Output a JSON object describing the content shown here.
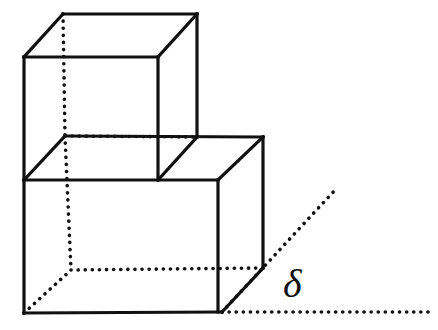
{
  "figure": {
    "background_color": "#ffffff",
    "stroke_color": "#111111",
    "solid_stroke_width": 3.2,
    "dotted_stroke_width": 3.6,
    "dot_pattern": "0.1 7",
    "canvas": {
      "width": 438,
      "height": 330
    },
    "labels": [
      {
        "name": "delta-angle-label",
        "text": "δ",
        "x": 283,
        "y": 297,
        "font_size": 40,
        "style": "italic"
      }
    ],
    "solid_edges": [
      {
        "name": "upper-top-back-edge",
        "x1": 63,
        "y1": 14,
        "x2": 197,
        "y2": 14
      },
      {
        "name": "upper-top-left-edge",
        "x1": 63,
        "y1": 14,
        "x2": 24,
        "y2": 57
      },
      {
        "name": "upper-top-right-edge",
        "x1": 197,
        "y1": 14,
        "x2": 158,
        "y2": 57
      },
      {
        "name": "upper-top-front-edge",
        "x1": 24,
        "y1": 57,
        "x2": 158,
        "y2": 57
      },
      {
        "name": "upper-left-vertical-edge",
        "x1": 24,
        "y1": 57,
        "x2": 24,
        "y2": 180
      },
      {
        "name": "upper-right-vertical-edge",
        "x1": 158,
        "y1": 57,
        "x2": 158,
        "y2": 180
      },
      {
        "name": "upper-back-right-vertical",
        "x1": 197,
        "y1": 14,
        "x2": 197,
        "y2": 137
      },
      {
        "name": "mid-left-diagonal-edge",
        "x1": 24,
        "y1": 180,
        "x2": 65,
        "y2": 136
      },
      {
        "name": "mid-platform-back-edge",
        "x1": 65,
        "y1": 136,
        "x2": 263,
        "y2": 137
      },
      {
        "name": "mid-right-diagonal-edge",
        "x1": 158,
        "y1": 180,
        "x2": 197,
        "y2": 137
      },
      {
        "name": "lower-top-front-edge",
        "x1": 24,
        "y1": 180,
        "x2": 218,
        "y2": 180
      },
      {
        "name": "lower-top-right-diagonal",
        "x1": 218,
        "y1": 180,
        "x2": 263,
        "y2": 137
      },
      {
        "name": "lower-back-right-vertical",
        "x1": 263,
        "y1": 137,
        "x2": 263,
        "y2": 268
      },
      {
        "name": "lower-left-vertical-edge",
        "x1": 24,
        "y1": 180,
        "x2": 24,
        "y2": 313
      },
      {
        "name": "lower-front-right-vertical",
        "x1": 218,
        "y1": 180,
        "x2": 218,
        "y2": 312
      },
      {
        "name": "lower-bottom-front-edge",
        "x1": 24,
        "y1": 313,
        "x2": 222,
        "y2": 312
      },
      {
        "name": "lower-bottom-right-diagonal",
        "x1": 222,
        "y1": 312,
        "x2": 263,
        "y2": 268
      }
    ],
    "dotted_edges": [
      {
        "name": "hidden-upper-back-left-vertical",
        "x1": 63,
        "y1": 14,
        "x2": 65,
        "y2": 136
      },
      {
        "name": "hidden-mid-back-edge",
        "x1": 65,
        "y1": 136,
        "x2": 197,
        "y2": 137
      },
      {
        "name": "hidden-lower-back-left-vertical",
        "x1": 65,
        "y1": 136,
        "x2": 71,
        "y2": 270
      },
      {
        "name": "hidden-bottom-back-edge",
        "x1": 71,
        "y1": 270,
        "x2": 263,
        "y2": 268
      },
      {
        "name": "hidden-bottom-left-diagonal",
        "x1": 24,
        "y1": 313,
        "x2": 71,
        "y2": 270
      },
      {
        "name": "ground-horizontal-ray",
        "x1": 222,
        "y1": 312,
        "x2": 430,
        "y2": 312
      },
      {
        "name": "inclined-angle-ray",
        "x1": 222,
        "y1": 312,
        "x2": 336,
        "y2": 189
      }
    ]
  }
}
